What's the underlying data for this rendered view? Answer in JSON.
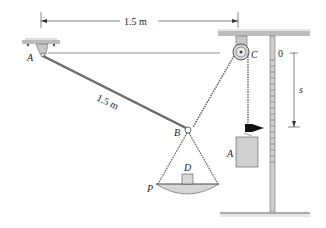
{
  "diagram": {
    "type": "mechanics-pulley-scale",
    "labels": {
      "A_support": "A",
      "B": "B",
      "C": "C",
      "D": "D",
      "P": "P",
      "A_weight": "A",
      "zero": "0",
      "s": "s"
    },
    "dimensions": {
      "horizontal": "1.5 m",
      "rod_length": "1.5 m"
    },
    "colors": {
      "metal": "#c8c8c8",
      "rod": "#555555",
      "line": "#333333",
      "block": "#d0d0d0",
      "flag": "#111111"
    }
  }
}
